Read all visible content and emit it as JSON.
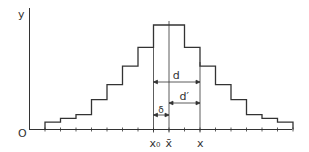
{
  "figure": {
    "y_axis_label": "y",
    "origin_label": "O",
    "x_labels": {
      "x0": "x₀",
      "xbar": "x̄",
      "x": "x"
    },
    "dimension_labels": {
      "d": "d",
      "d_prime": "d′",
      "delta": "δ"
    },
    "line_color": "#333333"
  },
  "chart_data": {
    "type": "bar",
    "title": "",
    "xlabel": "",
    "ylabel": "y",
    "histogram": true,
    "bins": 16,
    "values": [
      1,
      1.5,
      2,
      4,
      6,
      8.5,
      11,
      14,
      14,
      11,
      8.5,
      6,
      4,
      2,
      1.5,
      1
    ],
    "annotations": {
      "x0_bin_boundary": 7,
      "xbar_bin_center": 8,
      "x_bin_boundary": 9
    },
    "dimensions": [
      {
        "name": "d",
        "from": "x0",
        "to": "x"
      },
      {
        "name": "d'",
        "from": "xbar",
        "to": "x"
      },
      {
        "name": "delta",
        "from": "x0",
        "to": "xbar"
      }
    ],
    "grid": false
  }
}
